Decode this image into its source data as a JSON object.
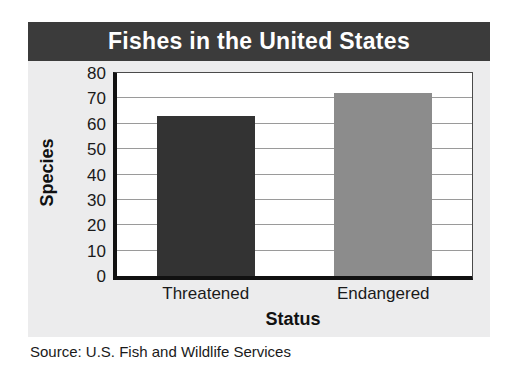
{
  "chart_data": {
    "type": "bar",
    "title": "Fishes in the United States",
    "xlabel": "Status",
    "ylabel": "Species",
    "categories": [
      "Threatened",
      "Endangered"
    ],
    "values": [
      63,
      72
    ],
    "series": [
      {
        "name": "Species",
        "values": [
          63,
          72
        ]
      }
    ],
    "yticks": [
      0,
      10,
      20,
      30,
      40,
      50,
      60,
      70,
      80
    ],
    "ytick_labels": [
      "0",
      "10",
      "20",
      "30",
      "40",
      "50",
      "60",
      "70",
      "80"
    ],
    "ylim": [
      0,
      80
    ],
    "grid": true,
    "legend": false,
    "bar_colors": [
      "#333333",
      "#8c8c8c"
    ],
    "source": "Source: U.S. Fish and Wildlife Services"
  },
  "figure": {
    "title": "Fishes in the United States",
    "title_band_color": "#3b3b3b",
    "panel_color": "#ececed",
    "plot_background": "#ffffff",
    "axis_color": "#111111",
    "gridline_color": "#9a9a9a"
  },
  "axes": {
    "y_title": "Species",
    "x_title": "Status",
    "y_labels": [
      "80",
      "70",
      "60",
      "50",
      "40",
      "30",
      "20",
      "10",
      "0"
    ],
    "x_labels": [
      "Threatened",
      "Endangered"
    ]
  },
  "footer": {
    "source_text": "Source: U.S. Fish and Wildlife Services"
  }
}
